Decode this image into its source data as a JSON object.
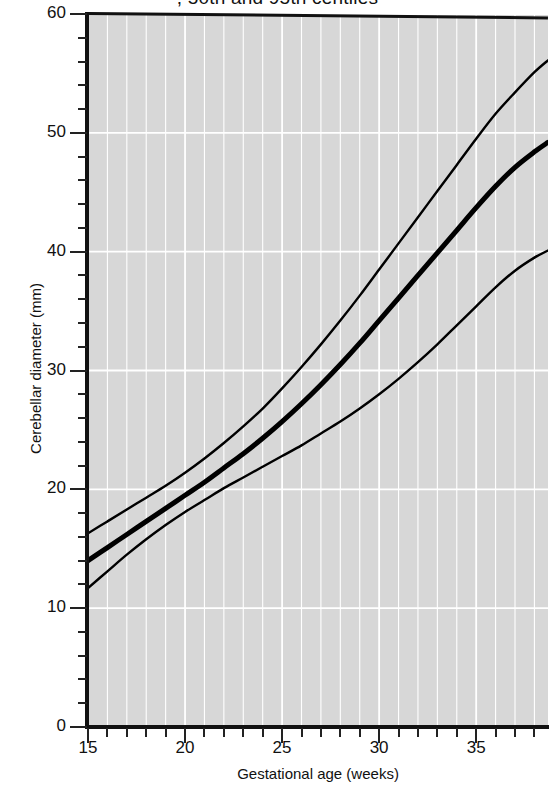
{
  "chart_data": {
    "type": "line",
    "title": ", 50th and 95th centiles",
    "xlabel": "Gestational age (weeks)",
    "ylabel": "Cerebellar diameter (mm)",
    "xlim": [
      15,
      38.7
    ],
    "ylim": [
      0,
      60
    ],
    "grid": true,
    "grid_color": "#ffffff",
    "plot_background": "#d7d7d7",
    "line_color": "#000000",
    "legend_position": "none",
    "x_major_ticks": [
      15,
      20,
      25,
      30,
      35
    ],
    "x_minor_tick_step": 1,
    "y_major_ticks": [
      0,
      10,
      20,
      30,
      40,
      50,
      60
    ],
    "y_minor_tick_step": 2,
    "x_tick_labels": [
      "15",
      "20",
      "25",
      "30",
      "35"
    ],
    "y_tick_labels": [
      "0",
      "10",
      "20",
      "30",
      "40",
      "50",
      "60"
    ],
    "x": [
      15,
      16,
      17,
      18,
      19,
      20,
      21,
      22,
      23,
      24,
      25,
      26,
      27,
      28,
      29,
      30,
      31,
      32,
      33,
      34,
      35,
      36,
      37,
      38,
      38.7
    ],
    "series": [
      {
        "name": "95th centile",
        "line_width": 2.4,
        "values": [
          16.3,
          17.3,
          18.3,
          19.3,
          20.3,
          21.4,
          22.6,
          23.9,
          25.3,
          26.8,
          28.5,
          30.3,
          32.2,
          34.2,
          36.3,
          38.5,
          40.7,
          42.9,
          45.1,
          47.3,
          49.5,
          51.6,
          53.4,
          55.1,
          56.1
        ]
      },
      {
        "name": "50th centile",
        "line_width": 5.0,
        "values": [
          14.0,
          15.1,
          16.2,
          17.3,
          18.4,
          19.5,
          20.6,
          21.8,
          23.0,
          24.3,
          25.7,
          27.2,
          28.8,
          30.5,
          32.3,
          34.2,
          36.1,
          38.0,
          39.9,
          41.8,
          43.7,
          45.5,
          47.1,
          48.4,
          49.2
        ]
      },
      {
        "name": "5th centile",
        "line_width": 2.4,
        "values": [
          11.7,
          13.1,
          14.5,
          15.8,
          17.0,
          18.1,
          19.1,
          20.1,
          21.0,
          21.9,
          22.8,
          23.7,
          24.7,
          25.7,
          26.8,
          28.0,
          29.3,
          30.7,
          32.2,
          33.8,
          35.4,
          37.0,
          38.4,
          39.5,
          40.1
        ]
      }
    ]
  }
}
